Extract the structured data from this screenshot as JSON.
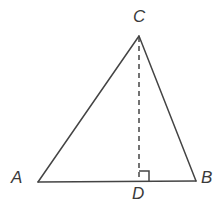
{
  "figure": {
    "background_color": "#ffffff",
    "stroke_color": "#444444",
    "label_color": "#3a3a3a",
    "stroke_width": 1.5,
    "canvas": {
      "width": 223,
      "height": 220
    }
  },
  "labels": {
    "apex": "C",
    "left_base": "A",
    "right_base": "B",
    "foot": "D"
  },
  "chart_data": {
    "type": "diagram",
    "shape": "triangle",
    "points": {
      "A": {
        "x": 38,
        "y": 182,
        "label": "A"
      },
      "B": {
        "x": 196,
        "y": 181,
        "label": "B"
      },
      "C": {
        "x": 139,
        "y": 36,
        "label": "C"
      },
      "D": {
        "x": 139,
        "y": 181,
        "label": "D"
      }
    },
    "segments": [
      {
        "name": "AC",
        "from": "A",
        "to": "C",
        "style": "solid"
      },
      {
        "name": "CB",
        "from": "C",
        "to": "B",
        "style": "solid"
      },
      {
        "name": "AB",
        "from": "A",
        "to": "B",
        "style": "solid"
      },
      {
        "name": "CD",
        "from": "C",
        "to": "D",
        "style": "dashed"
      }
    ],
    "dash_pattern": "5,4",
    "right_angle": {
      "at": "D",
      "size": 10,
      "side": "right",
      "marker": "square"
    },
    "annotations": [
      "CD is the altitude from C perpendicular to AB at D"
    ]
  }
}
